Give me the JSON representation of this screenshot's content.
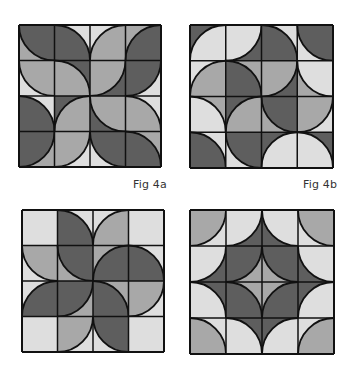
{
  "colors": {
    "dark": "#5e5e5e",
    "medium": "#a8a8a8",
    "light": "#dedede",
    "outline": "#111111",
    "background": "#ffffff"
  },
  "figures": [
    {
      "id": "fig4a",
      "label": "Fig 4a",
      "x": 18,
      "y": 24,
      "size": 142,
      "label_pos": {
        "x": 133,
        "y": 178
      },
      "tiles": [
        [
          {
            "c": "tr",
            "in": "dark",
            "out": "medium"
          },
          {
            "c": "bl",
            "in": "dark",
            "out": "light"
          },
          {
            "c": "br",
            "in": "medium",
            "out": "light"
          },
          {
            "c": "br",
            "in": "dark",
            "out": "medium"
          }
        ],
        [
          {
            "c": "tr",
            "in": "medium",
            "out": "light"
          },
          {
            "c": "bl",
            "in": "medium",
            "out": "dark"
          },
          {
            "c": "tl",
            "in": "medium",
            "out": "dark"
          },
          {
            "c": "tl",
            "in": "dark",
            "out": "light"
          }
        ],
        [
          {
            "c": "bl",
            "in": "dark",
            "out": "light"
          },
          {
            "c": "br",
            "in": "medium",
            "out": "dark"
          },
          {
            "c": "tr",
            "in": "medium",
            "out": "dark"
          },
          {
            "c": "bl",
            "in": "medium",
            "out": "light"
          }
        ],
        [
          {
            "c": "tl",
            "in": "dark",
            "out": "medium"
          },
          {
            "c": "tl",
            "in": "medium",
            "out": "light"
          },
          {
            "c": "tr",
            "in": "dark",
            "out": "light"
          },
          {
            "c": "bl",
            "in": "dark",
            "out": "medium"
          }
        ]
      ]
    },
    {
      "id": "fig4b",
      "label": "Fig 4b",
      "x": 189,
      "y": 24,
      "size": 143,
      "label_pos": {
        "x": 303,
        "y": 178
      },
      "tiles": [
        [
          {
            "c": "br",
            "in": "light",
            "out": "dark"
          },
          {
            "c": "tl",
            "in": "light",
            "out": "dark"
          },
          {
            "c": "bl",
            "in": "dark",
            "out": "light"
          },
          {
            "c": "tr",
            "in": "dark",
            "out": "light"
          }
        ],
        [
          {
            "c": "br",
            "in": "medium",
            "out": "light"
          },
          {
            "c": "bl",
            "in": "dark",
            "out": "medium"
          },
          {
            "c": "tl",
            "in": "medium",
            "out": "dark"
          },
          {
            "c": "tr",
            "in": "light",
            "out": "medium"
          }
        ],
        [
          {
            "c": "bl",
            "in": "light",
            "out": "medium"
          },
          {
            "c": "br",
            "in": "medium",
            "out": "dark"
          },
          {
            "c": "tr",
            "in": "dark",
            "out": "medium"
          },
          {
            "c": "tl",
            "in": "medium",
            "out": "light"
          }
        ],
        [
          {
            "c": "bl",
            "in": "dark",
            "out": "light"
          },
          {
            "c": "tr",
            "in": "dark",
            "out": "light"
          },
          {
            "c": "br",
            "in": "light",
            "out": "dark"
          },
          {
            "c": "bl",
            "in": "light",
            "out": "dark"
          }
        ]
      ]
    },
    {
      "id": "fig4c",
      "label": "",
      "x": 21,
      "y": 209,
      "size": 142,
      "tiles": [
        [
          {
            "c": "none",
            "in": "light",
            "out": "light"
          },
          {
            "c": "bl",
            "in": "dark",
            "out": "light"
          },
          {
            "c": "br",
            "in": "medium",
            "out": "light"
          },
          {
            "c": "none",
            "in": "light",
            "out": "light"
          }
        ],
        [
          {
            "c": "tr",
            "in": "medium",
            "out": "light"
          },
          {
            "c": "tr",
            "in": "dark",
            "out": "medium"
          },
          {
            "c": "br",
            "in": "dark",
            "out": "medium"
          },
          {
            "c": "bl",
            "in": "dark",
            "out": "light"
          }
        ],
        [
          {
            "c": "br",
            "in": "dark",
            "out": "light"
          },
          {
            "c": "tl",
            "in": "dark",
            "out": "medium"
          },
          {
            "c": "bl",
            "in": "dark",
            "out": "medium"
          },
          {
            "c": "tl",
            "in": "medium",
            "out": "light"
          }
        ],
        [
          {
            "c": "none",
            "in": "light",
            "out": "light"
          },
          {
            "c": "tl",
            "in": "medium",
            "out": "light"
          },
          {
            "c": "tr",
            "in": "dark",
            "out": "light"
          },
          {
            "c": "none",
            "in": "light",
            "out": "light"
          }
        ]
      ]
    },
    {
      "id": "fig4d",
      "label": "",
      "x": 189,
      "y": 209,
      "size": 144,
      "tiles": [
        [
          {
            "c": "tl",
            "in": "medium",
            "out": "light"
          },
          {
            "c": "tl",
            "in": "light",
            "out": "dark"
          },
          {
            "c": "tr",
            "in": "light",
            "out": "dark"
          },
          {
            "c": "tr",
            "in": "medium",
            "out": "light"
          }
        ],
        [
          {
            "c": "tl",
            "in": "light",
            "out": "dark"
          },
          {
            "c": "tl",
            "in": "dark",
            "out": "medium"
          },
          {
            "c": "tr",
            "in": "dark",
            "out": "medium"
          },
          {
            "c": "tr",
            "in": "light",
            "out": "dark"
          }
        ],
        [
          {
            "c": "bl",
            "in": "light",
            "out": "dark"
          },
          {
            "c": "bl",
            "in": "dark",
            "out": "medium"
          },
          {
            "c": "br",
            "in": "dark",
            "out": "medium"
          },
          {
            "c": "br",
            "in": "light",
            "out": "dark"
          }
        ],
        [
          {
            "c": "bl",
            "in": "medium",
            "out": "light"
          },
          {
            "c": "bl",
            "in": "light",
            "out": "dark"
          },
          {
            "c": "br",
            "in": "light",
            "out": "dark"
          },
          {
            "c": "br",
            "in": "medium",
            "out": "light"
          }
        ]
      ]
    }
  ]
}
